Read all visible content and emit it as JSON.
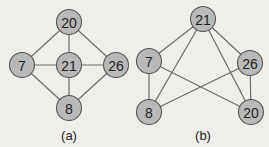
{
  "colors": {
    "background": "#efeeeb",
    "node_fill": "#b9b9b9",
    "node_stroke": "#555555",
    "edge": "#6b6b6b"
  },
  "graphs": [
    {
      "caption": "(a)",
      "nodes": [
        {
          "id": "20",
          "label": "20",
          "x": 69,
          "y": 22
        },
        {
          "id": "7",
          "label": "7",
          "x": 22,
          "y": 65
        },
        {
          "id": "21",
          "label": "21",
          "x": 69,
          "y": 65
        },
        {
          "id": "26",
          "label": "26",
          "x": 116,
          "y": 65
        },
        {
          "id": "8",
          "label": "8",
          "x": 69,
          "y": 108
        }
      ],
      "edges": [
        [
          "20",
          "7"
        ],
        [
          "20",
          "21"
        ],
        [
          "20",
          "26"
        ],
        [
          "7",
          "21"
        ],
        [
          "21",
          "26"
        ],
        [
          "7",
          "8"
        ],
        [
          "21",
          "8"
        ],
        [
          "26",
          "8"
        ]
      ],
      "caption_pos": {
        "x": 69,
        "y": 140
      }
    },
    {
      "caption": "(b)",
      "nodes": [
        {
          "id": "21",
          "label": "21",
          "x": 203,
          "y": 19
        },
        {
          "id": "7",
          "label": "7",
          "x": 149,
          "y": 61
        },
        {
          "id": "26",
          "label": "26",
          "x": 250,
          "y": 63
        },
        {
          "id": "8",
          "label": "8",
          "x": 149,
          "y": 112
        },
        {
          "id": "20",
          "label": "20",
          "x": 251,
          "y": 112
        }
      ],
      "edges": [
        [
          "21",
          "7"
        ],
        [
          "21",
          "26"
        ],
        [
          "21",
          "8"
        ],
        [
          "21",
          "20"
        ],
        [
          "7",
          "8"
        ],
        [
          "7",
          "20"
        ],
        [
          "26",
          "8"
        ],
        [
          "26",
          "20"
        ]
      ],
      "caption_pos": {
        "x": 203,
        "y": 140
      }
    }
  ]
}
